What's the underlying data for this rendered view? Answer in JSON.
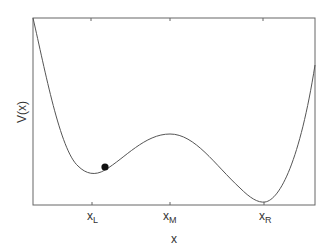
{
  "figure": {
    "ylabel": "V(x)",
    "xlabel": "x",
    "ticks": [
      {
        "main": "x",
        "sub": "L"
      },
      {
        "main": "x",
        "sub": "M"
      },
      {
        "main": "x",
        "sub": "R"
      }
    ],
    "colors": {
      "curve": "#555555",
      "axes": "#666666",
      "ball": "#111111"
    }
  }
}
